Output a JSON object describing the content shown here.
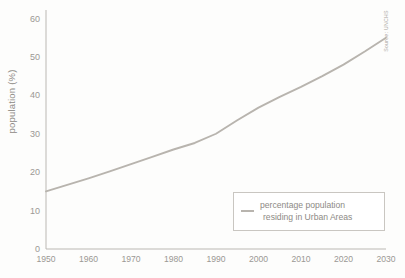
{
  "chart_data": {
    "type": "line",
    "title": "",
    "xlabel": "",
    "ylabel": "population (%)",
    "source_note": "Source: UNCHS",
    "xlim": [
      1950,
      2030
    ],
    "ylim": [
      0,
      60
    ],
    "xticks": [
      1950,
      1960,
      1970,
      1980,
      1990,
      2000,
      2010,
      2020,
      2030
    ],
    "yticks": [
      0,
      10,
      20,
      30,
      40,
      50,
      60
    ],
    "grid": false,
    "legend_position": "inside-bottom-right",
    "series": [
      {
        "name": "percentage population residing in Urban Areas",
        "legend_line_1": "percentage population",
        "legend_line_2": "residing in Urban Areas",
        "color": "#b8b4ae",
        "x": [
          1950,
          1955,
          1960,
          1965,
          1970,
          1975,
          1980,
          1985,
          1990,
          1995,
          2000,
          2005,
          2010,
          2015,
          2020,
          2025,
          2030
        ],
        "values": [
          15.0,
          16.7,
          18.4,
          20.2,
          22.1,
          24.0,
          25.9,
          27.6,
          30.0,
          33.5,
          36.8,
          39.6,
          42.2,
          45.0,
          48.0,
          51.4,
          55.0
        ]
      }
    ]
  },
  "axis": {
    "y_label": "population (%)",
    "tick_labels_y": [
      "60",
      "50",
      "40",
      "30",
      "20",
      "10",
      "0"
    ],
    "tick_labels_x": [
      "1950",
      "1960",
      "1970",
      "1980",
      "1990",
      "2000",
      "2010",
      "2020",
      "2030"
    ]
  },
  "colors": {
    "line": "#b8b4ae",
    "axis": "#bbb8b3",
    "text": "#9b9894",
    "legend_border": "#c9c6c1"
  }
}
